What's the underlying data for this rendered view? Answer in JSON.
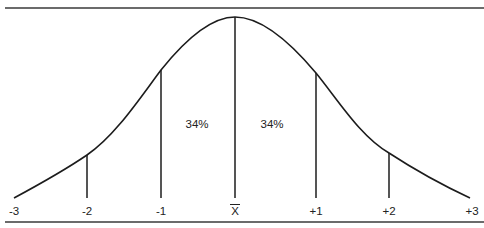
{
  "diagram": {
    "axis_labels": [
      "-3",
      "-2",
      "-1",
      "X",
      "+1",
      "+2",
      "+3"
    ],
    "mean_label": "X",
    "mean_label_has_overbar": true,
    "region_labels": [
      {
        "text": "34%",
        "between": [
          "-1",
          "X"
        ]
      },
      {
        "text": "34%",
        "between": [
          "X",
          "+1"
        ]
      }
    ],
    "vertical_lines_at": [
      "-2",
      "-1",
      "X",
      "+1",
      "+2"
    ],
    "colors": {
      "line": "#1c1c1c",
      "rule": "#3a3a3a",
      "background": "#ffffff"
    }
  }
}
